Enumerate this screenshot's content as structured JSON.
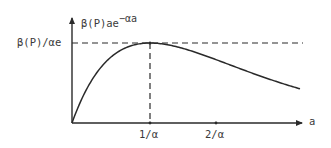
{
  "chart_data": {
    "type": "line",
    "title": "",
    "function": "β(P) a e^(−αa)",
    "ylabel": "β(P)ae^−αa",
    "ylabel_parts": {
      "base": "β(P)ae",
      "exponent": "−αa"
    },
    "xlabel": "a",
    "x_ticks": [
      {
        "label": "1/α",
        "value": 1
      },
      {
        "label": "2/α",
        "value": 2
      }
    ],
    "y_ticks": [
      {
        "label": "β(P)/αe",
        "value": 0.3679
      }
    ],
    "annotations": [
      {
        "type": "dashed-hline",
        "at": "β(P)/αe",
        "description": "maximum value"
      },
      {
        "type": "dashed-vline",
        "at": "1/α",
        "description": "location of maximum"
      }
    ],
    "x": [
      0,
      0.25,
      0.5,
      0.75,
      1.0,
      1.25,
      1.5,
      1.75,
      2.0,
      2.5,
      3.0,
      3.5,
      4.0
    ],
    "values": [
      0,
      0.195,
      0.303,
      0.354,
      0.368,
      0.358,
      0.335,
      0.304,
      0.271,
      0.205,
      0.149,
      0.106,
      0.073
    ],
    "xlim": [
      0,
      4.0
    ],
    "ylim": [
      0,
      0.42
    ],
    "grid": false,
    "legend": null,
    "color": "#2a2a2a"
  },
  "labels": {
    "y_axis_base": "β(P)ae",
    "y_axis_exp": "−αa",
    "y_max": "β(P)/αe",
    "x_tick_1": "1/α",
    "x_tick_2": "2/α",
    "x_axis": "a"
  }
}
